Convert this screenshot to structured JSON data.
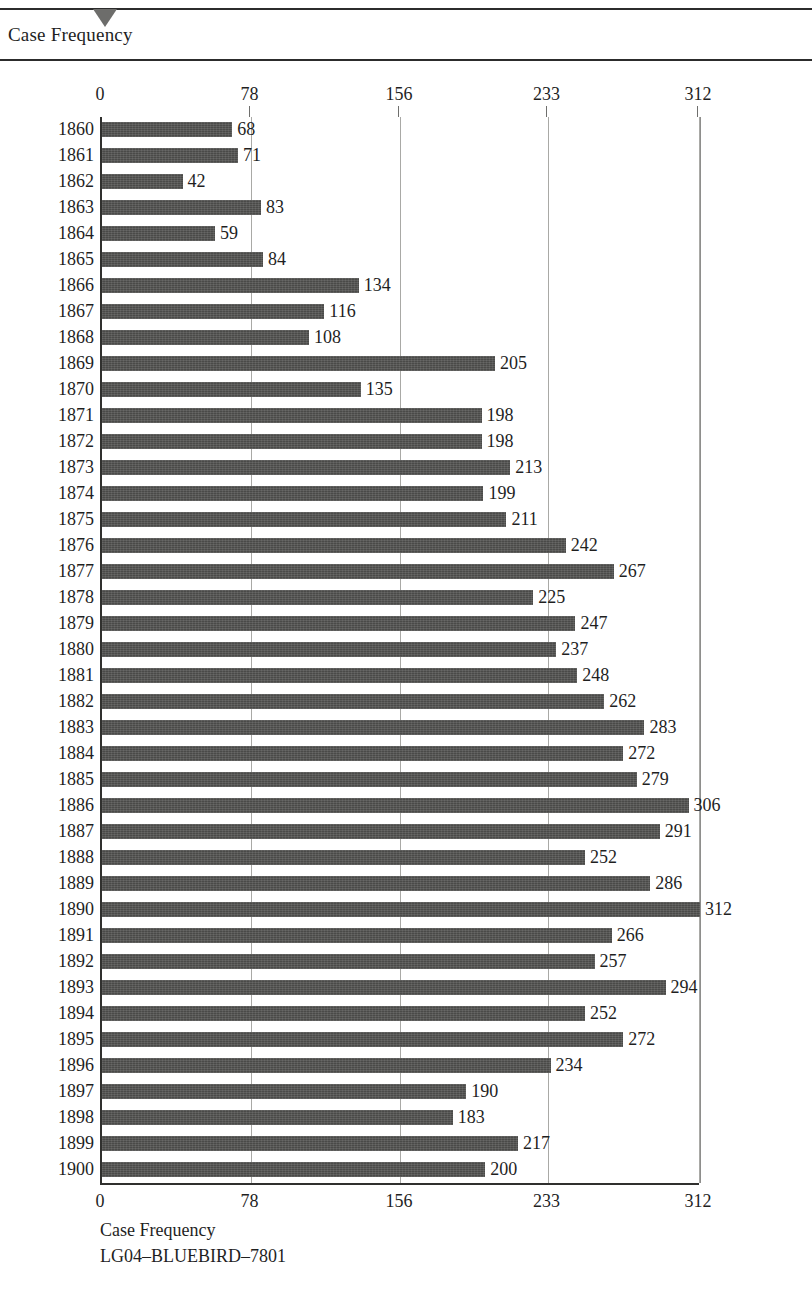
{
  "header": {
    "title": "Case Frequency",
    "marker_icon": "triangle-down-icon"
  },
  "footer": {
    "axis_caption": "Case Frequency",
    "record_id": "LG04–BLUEBIRD–7801"
  },
  "colors": {
    "bar": "#4a4a48",
    "axis": "#30302e",
    "gridline": "#a9a9a6",
    "text": "#1f1f1f",
    "background": "#ffffff",
    "marker": "#6d6d6b"
  },
  "chart_data": {
    "type": "bar",
    "orientation": "horizontal",
    "title": "Case Frequency",
    "xlabel": "Case Frequency",
    "ylabel": "",
    "xlim": [
      0,
      312
    ],
    "xticks": [
      0,
      78,
      156,
      233,
      312
    ],
    "xticklabels": [
      "0",
      "78",
      "156",
      "233",
      "312"
    ],
    "grid": true,
    "grid_axis": "x",
    "legend": false,
    "axis_top": true,
    "axis_bottom": true,
    "categories": [
      "1860",
      "1861",
      "1862",
      "1863",
      "1864",
      "1865",
      "1866",
      "1867",
      "1868",
      "1869",
      "1870",
      "1871",
      "1872",
      "1873",
      "1874",
      "1875",
      "1876",
      "1877",
      "1878",
      "1879",
      "1880",
      "1881",
      "1882",
      "1883",
      "1884",
      "1885",
      "1886",
      "1887",
      "1888",
      "1889",
      "1890",
      "1891",
      "1892",
      "1893",
      "1894",
      "1895",
      "1896",
      "1897",
      "1898",
      "1899",
      "1900"
    ],
    "values": [
      68,
      71,
      42,
      83,
      59,
      84,
      134,
      116,
      108,
      205,
      135,
      198,
      198,
      213,
      199,
      211,
      242,
      267,
      225,
      247,
      237,
      248,
      262,
      283,
      272,
      279,
      306,
      291,
      252,
      286,
      312,
      266,
      257,
      294,
      252,
      272,
      234,
      190,
      183,
      217,
      200
    ],
    "data_labels": [
      "68",
      "71",
      "42",
      "83",
      "59",
      "84",
      "134",
      "116",
      "108",
      "205",
      "135",
      "198",
      "198",
      "213",
      "199",
      "211",
      "242",
      "267",
      "225",
      "247",
      "237",
      "248",
      "262",
      "283",
      "272",
      "279",
      "306",
      "291",
      "252",
      "286",
      "312",
      "266",
      "257",
      "294",
      "252",
      "272",
      "234",
      "190",
      "183",
      "217",
      "200"
    ]
  }
}
